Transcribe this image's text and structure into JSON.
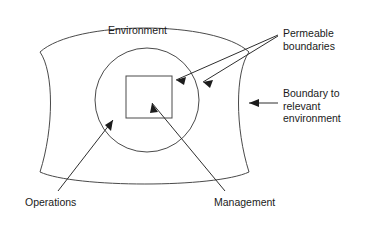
{
  "diagram": {
    "title_text": "",
    "colors": {
      "background": "#ffffff",
      "stroke": "#3b3b3b",
      "shape_stroke": "#4a4a4a",
      "arrow": "#1c1c1c",
      "text": "#1a1a1a"
    },
    "labels": {
      "environment": "Environment",
      "permeable_boundaries": "Permeable\nboundaries",
      "boundary_to_relevant_environment": "Boundary to\nrelevant\nenvironment",
      "operations": "Operations",
      "management": "Management"
    },
    "shapes": {
      "outer_boundary_name": "lens-shaped outer boundary",
      "middle_circle_name": "operations circle",
      "inner_square_name": "management square"
    },
    "icons": {
      "arrow_permeable_square": "arrow-icon",
      "arrow_permeable_circle": "arrow-icon",
      "arrow_boundary": "arrow-icon",
      "arrow_operations": "arrow-icon",
      "arrow_management": "arrow-icon"
    }
  }
}
